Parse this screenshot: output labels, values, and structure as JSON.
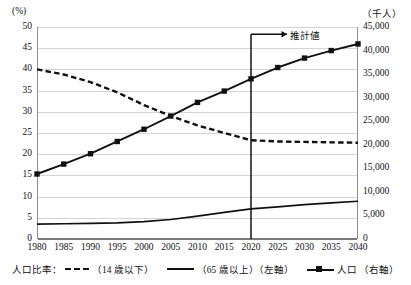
{
  "axes": {
    "left_unit": "(%)",
    "right_unit": "（千人）",
    "left_ticks": [
      "0",
      "5",
      "10",
      "15",
      "20",
      "25",
      "30",
      "35",
      "40",
      "45",
      "50"
    ],
    "right_ticks": [
      "0",
      "5,000",
      "10,000",
      "15,000",
      "20,000",
      "25,000",
      "30,000",
      "35,000",
      "40,000",
      "45,000"
    ],
    "x_ticks": [
      "1980",
      "1985",
      "1990",
      "1995",
      "2000",
      "2005",
      "2010",
      "2015",
      "2020",
      "2025",
      "2030",
      "2035",
      "2040"
    ]
  },
  "annotation": {
    "projection_label": "推計値"
  },
  "legend": {
    "prefix": "人口比率：",
    "item_children": "（14 歳以下）",
    "item_elderly": "（65 歳以上）（左軸）",
    "item_population": "人口 （右軸）"
  },
  "chart_data": {
    "type": "line",
    "title": "",
    "xlabel": "",
    "ylabel": "(%)",
    "y2label": "（千人）",
    "x": [
      1980,
      1985,
      1990,
      1995,
      2000,
      2005,
      2010,
      2015,
      2020,
      2025,
      2030,
      2035,
      2040
    ],
    "xlim": [
      1980,
      2040
    ],
    "ylim": [
      0,
      50
    ],
    "y2lim": [
      0,
      45000
    ],
    "grid": true,
    "legend_position": "bottom",
    "annotations": [
      {
        "text": "推計値",
        "x": 2020,
        "note": "vertical line at 2020 marks start of projected values, arrow points right"
      }
    ],
    "series": [
      {
        "name": "（14 歳以下）人口比率",
        "axis": "left",
        "style": "dashed",
        "unit": "%",
        "values": [
          40.0,
          38.8,
          37.0,
          34.6,
          31.6,
          29.0,
          26.8,
          25.0,
          23.3,
          23.0,
          22.9,
          22.8,
          22.7
        ]
      },
      {
        "name": "（65 歳以上）人口比率",
        "axis": "left",
        "style": "solid",
        "unit": "%",
        "values": [
          3.5,
          3.6,
          3.7,
          3.8,
          4.1,
          4.6,
          5.4,
          6.3,
          7.1,
          7.6,
          8.1,
          8.5,
          8.9
        ]
      },
      {
        "name": "人口",
        "axis": "right",
        "style": "solid-marker",
        "unit": "千人",
        "values": [
          13800,
          15900,
          18100,
          20700,
          23300,
          26100,
          29000,
          31400,
          34000,
          36400,
          38400,
          40000,
          41400
        ]
      }
    ]
  }
}
